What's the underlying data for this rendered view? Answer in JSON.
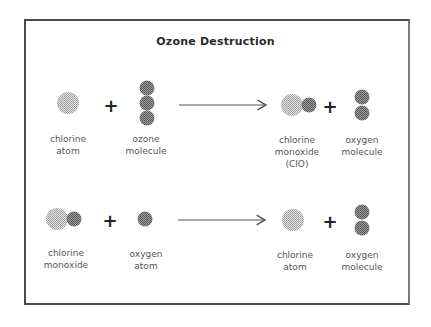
{
  "title": "Ozone Destruction",
  "colors": {
    "chlorine": "#bdbdbd",
    "oxygen": "#7d7d7d",
    "frame": "#4a4a4a",
    "arrow": "#555555"
  },
  "reactions": [
    {
      "reactants": [
        {
          "label_lines": [
            "chlorine",
            "atom"
          ]
        },
        {
          "label_lines": [
            "ozone",
            "molecule"
          ]
        }
      ],
      "products": [
        {
          "label_lines": [
            "chlorine",
            "monoxide",
            "(ClO)"
          ]
        },
        {
          "label_lines": [
            "oxygen",
            "molecule"
          ]
        }
      ],
      "plus": "+"
    },
    {
      "reactants": [
        {
          "label_lines": [
            "chlorine",
            "monoxide"
          ]
        },
        {
          "label_lines": [
            "oxygen",
            "atom"
          ]
        }
      ],
      "products": [
        {
          "label_lines": [
            "chlorine",
            "atom"
          ]
        },
        {
          "label_lines": [
            "oxygen",
            "molecule"
          ]
        }
      ],
      "plus": "+"
    }
  ]
}
